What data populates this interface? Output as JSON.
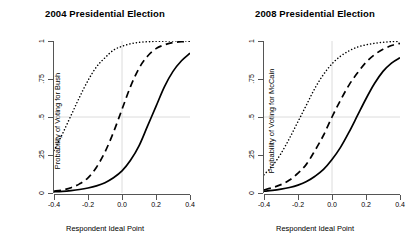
{
  "figure": {
    "xlabel": "Respondent Ideal Point",
    "xticks": [
      "-0.4",
      "-0.2",
      "0.0",
      "0.2",
      "0.4"
    ],
    "yticks": [
      "0",
      ".25",
      ".5",
      ".75",
      "1"
    ]
  },
  "chart_data": [
    {
      "type": "line",
      "title": "2004 Presidential Election",
      "xlabel": "Respondent Ideal Point",
      "ylabel": "Probability of Voting for Bush",
      "xlim": [
        -0.4,
        0.4
      ],
      "ylim": [
        0,
        1
      ],
      "xticks": [
        -0.4,
        -0.2,
        0.0,
        0.2,
        0.4
      ],
      "xticklabels": [
        "-0.4",
        "-0.2",
        "0.0",
        "0.2",
        "0.4"
      ],
      "yticks": [
        0,
        0.25,
        0.5,
        0.75,
        1
      ],
      "yticklabels": [
        "0",
        ".25",
        ".5",
        ".75",
        "1"
      ],
      "grid": false,
      "reference_lines": [
        {
          "orientation": "horizontal",
          "value": 0.5,
          "color": "#dcdcdc"
        },
        {
          "orientation": "vertical",
          "value": 0.0,
          "color": "#dcdcdc"
        }
      ],
      "legend": "none",
      "x": [
        -0.4,
        -0.35,
        -0.3,
        -0.25,
        -0.2,
        -0.15,
        -0.1,
        -0.05,
        0.0,
        0.05,
        0.1,
        0.15,
        0.2,
        0.25,
        0.3,
        0.35,
        0.4
      ],
      "series": [
        {
          "name": "dotted",
          "style": "dotted",
          "values": [
            0.28,
            0.39,
            0.51,
            0.63,
            0.74,
            0.83,
            0.89,
            0.94,
            0.965,
            0.982,
            0.991,
            0.995,
            0.998,
            0.999,
            1.0,
            1.0,
            1.0
          ]
        },
        {
          "name": "dashed",
          "style": "dashed",
          "values": [
            0.012,
            0.02,
            0.035,
            0.06,
            0.1,
            0.17,
            0.27,
            0.4,
            0.55,
            0.7,
            0.82,
            0.9,
            0.95,
            0.975,
            0.99,
            0.995,
            1.0
          ]
        },
        {
          "name": "solid",
          "style": "solid",
          "values": [
            0.008,
            0.011,
            0.016,
            0.023,
            0.033,
            0.047,
            0.068,
            0.1,
            0.145,
            0.215,
            0.31,
            0.44,
            0.57,
            0.7,
            0.8,
            0.87,
            0.92
          ]
        }
      ]
    },
    {
      "type": "line",
      "title": "2008 Presidential Election",
      "xlabel": "Respondent Ideal Point",
      "ylabel": "Probability of Voting for McCain",
      "xlim": [
        -0.4,
        0.4
      ],
      "ylim": [
        0,
        1
      ],
      "xticks": [
        -0.4,
        -0.2,
        0.0,
        0.2,
        0.4
      ],
      "xticklabels": [
        "-0.4",
        "-0.2",
        "0.0",
        "0.2",
        "0.4"
      ],
      "yticks": [
        0,
        0.25,
        0.5,
        0.75,
        1
      ],
      "yticklabels": [
        "0",
        ".25",
        ".5",
        ".75",
        "1"
      ],
      "grid": false,
      "reference_lines": [
        {
          "orientation": "horizontal",
          "value": 0.5,
          "color": "#dcdcdc"
        },
        {
          "orientation": "vertical",
          "value": 0.0,
          "color": "#dcdcdc"
        }
      ],
      "legend": "none",
      "x": [
        -0.4,
        -0.35,
        -0.3,
        -0.25,
        -0.2,
        -0.15,
        -0.1,
        -0.05,
        0.0,
        0.05,
        0.1,
        0.15,
        0.2,
        0.25,
        0.3,
        0.35,
        0.4
      ],
      "series": [
        {
          "name": "dotted",
          "style": "dotted",
          "values": [
            0.12,
            0.18,
            0.26,
            0.36,
            0.47,
            0.58,
            0.69,
            0.78,
            0.85,
            0.9,
            0.935,
            0.96,
            0.975,
            0.985,
            0.992,
            0.996,
            0.998
          ]
        },
        {
          "name": "dashed",
          "style": "dashed",
          "values": [
            0.02,
            0.035,
            0.055,
            0.085,
            0.13,
            0.19,
            0.28,
            0.38,
            0.5,
            0.61,
            0.71,
            0.79,
            0.86,
            0.91,
            0.945,
            0.97,
            0.985
          ]
        },
        {
          "name": "solid",
          "style": "solid",
          "values": [
            0.012,
            0.017,
            0.025,
            0.036,
            0.052,
            0.075,
            0.11,
            0.155,
            0.22,
            0.3,
            0.4,
            0.51,
            0.62,
            0.72,
            0.8,
            0.855,
            0.89
          ]
        }
      ]
    }
  ]
}
